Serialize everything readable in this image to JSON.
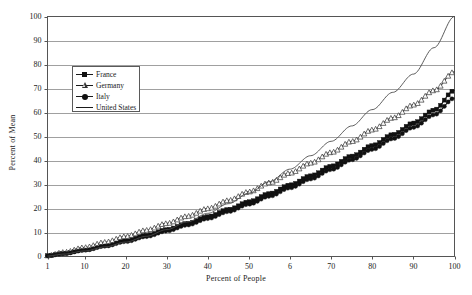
{
  "chart_data": {
    "type": "line",
    "title": "",
    "xlabel": "Percent of People",
    "ylabel": "Percent of Mean",
    "xlim": [
      1,
      100
    ],
    "ylim": [
      0,
      100
    ],
    "grid": true,
    "grid_axis": "y",
    "legend_position": "upper-left-inside",
    "xticks": [
      1,
      10,
      20,
      30,
      40,
      50,
      60,
      70,
      80,
      90,
      100
    ],
    "xtick_labels": [
      "1",
      "10",
      "20",
      "30",
      "40",
      "50",
      "6",
      "70",
      "80",
      "90",
      "100"
    ],
    "yticks": [
      0,
      10,
      20,
      30,
      40,
      50,
      60,
      70,
      80,
      90,
      100
    ],
    "ytick_labels": [
      "0",
      "10",
      "20",
      "30",
      "40",
      "50",
      "60",
      "70",
      "80",
      "90",
      "100"
    ],
    "x": [
      1,
      5,
      10,
      15,
      20,
      25,
      30,
      35,
      40,
      45,
      50,
      55,
      60,
      65,
      70,
      75,
      80,
      85,
      90,
      95,
      100
    ],
    "series": [
      {
        "name": "France",
        "marker": "filled-square",
        "color": "#111111",
        "values": [
          0.3,
          1.3,
          2.8,
          4.6,
          6.6,
          8.8,
          11.2,
          13.8,
          16.6,
          19.6,
          22.8,
          26.2,
          29.8,
          33.6,
          37.6,
          41.8,
          46.2,
          50.8,
          55.6,
          61.0,
          69.2
        ]
      },
      {
        "name": "Germany",
        "marker": "open-triangle",
        "color": "#333333",
        "values": [
          0.4,
          1.8,
          3.8,
          6.0,
          8.4,
          11.0,
          13.8,
          16.8,
          20.0,
          23.4,
          27.0,
          30.8,
          34.8,
          39.0,
          43.4,
          48.0,
          52.8,
          57.8,
          63.2,
          69.2,
          77.0
        ]
      },
      {
        "name": "Italy",
        "marker": "filled-circle",
        "color": "#111111",
        "values": [
          0.3,
          1.2,
          2.6,
          4.3,
          6.2,
          8.3,
          10.6,
          13.1,
          15.8,
          18.7,
          21.8,
          25.1,
          28.6,
          32.3,
          36.2,
          40.3,
          44.6,
          49.1,
          53.8,
          59.0,
          66.0
        ]
      },
      {
        "name": "United States",
        "marker": "none",
        "color": "#4a4a4a",
        "values": [
          0.2,
          1.0,
          2.3,
          4.0,
          6.0,
          8.4,
          11.2,
          14.4,
          18.0,
          22.0,
          26.4,
          31.2,
          36.4,
          42.0,
          48.0,
          54.4,
          61.2,
          68.4,
          76.0,
          87.0,
          100.0
        ]
      }
    ]
  },
  "legend": {
    "items": [
      {
        "label": "France"
      },
      {
        "label": "Germany"
      },
      {
        "label": "Italy"
      },
      {
        "label": "United States"
      }
    ]
  },
  "caption": {
    "text": ""
  }
}
